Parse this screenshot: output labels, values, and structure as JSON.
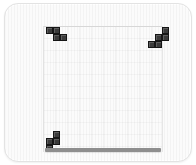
{
  "app": {
    "title": "Tetris",
    "screen_width": 196,
    "screen_height": 165
  },
  "theme": {
    "background": "#ffffff",
    "panel_fill": "#fbfbfb",
    "panel_border": "#e3e3e3",
    "grid_line": "#e8e8e8",
    "block_fill": "#3a3a3a",
    "block_border": "#151515",
    "floor_bar": "#8e8e8e"
  },
  "board": {
    "label": "playfield",
    "columns": 10,
    "rows": 18,
    "grid_visible": true,
    "cell_size": 7
  },
  "pieces": [
    {
      "id": "piece-top-left",
      "name": "J-piece",
      "color": "#3a3a3a",
      "cells": [
        {
          "col": 0,
          "row": 0
        },
        {
          "col": 1,
          "row": 0
        },
        {
          "col": 1,
          "row": 1
        },
        {
          "col": 2,
          "row": 1
        }
      ]
    },
    {
      "id": "piece-top-right",
      "name": "S-piece",
      "color": "#3a3a3a",
      "cells": [
        {
          "col": 2,
          "row": 0
        },
        {
          "col": 1,
          "row": 1
        },
        {
          "col": 2,
          "row": 1
        },
        {
          "col": 0,
          "row": 2
        },
        {
          "col": 1,
          "row": 2
        }
      ]
    },
    {
      "id": "piece-bottom",
      "name": "S-piece",
      "color": "#3a3a3a",
      "cells": [
        {
          "col": 1,
          "row": 0
        },
        {
          "col": 1,
          "row": 1
        },
        {
          "col": 0,
          "row": 1
        },
        {
          "col": 0,
          "row": 2
        }
      ]
    }
  ],
  "floor": {
    "name": "stack-floor",
    "color": "#8e8e8e"
  }
}
